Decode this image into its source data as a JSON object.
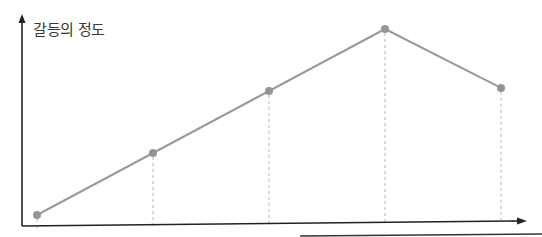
{
  "chart_data": {
    "type": "line",
    "title": "",
    "ylabel": "갈등의 정도",
    "xlabel": "",
    "x": [
      1,
      2,
      3,
      4,
      5
    ],
    "categories": [
      "",
      "",
      "",
      "",
      ""
    ],
    "series": [
      {
        "name": "갈등의 정도",
        "values": [
          1,
          2,
          3,
          4,
          3.05
        ]
      }
    ],
    "ylim": [
      0.9,
      4.2
    ],
    "grid": false,
    "axis_ticks": false,
    "drop_lines": "dashed vertical lines from each point to x-axis",
    "colors": {
      "line": "#9a9a9a",
      "marker": "#959595",
      "axis": "#222222",
      "dropline": "#b8b8b8"
    }
  }
}
